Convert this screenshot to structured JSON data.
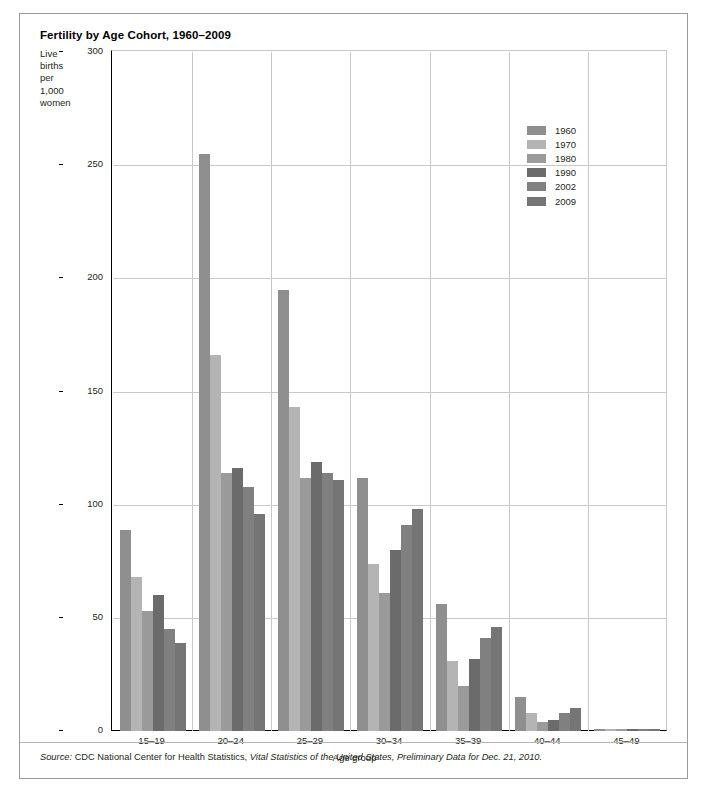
{
  "chart_data": {
    "type": "bar",
    "title": "Fertility by Age Cohort, 1960–2009",
    "xlabel": "Age group",
    "ylabel": "Live births per 1,000 women",
    "ylabel_lines": [
      "Live",
      "births",
      "per",
      "1,000",
      "women"
    ],
    "ylim": [
      0,
      300
    ],
    "yticks": [
      0,
      50,
      100,
      150,
      200,
      250,
      300
    ],
    "ytick_labels": [
      "0",
      "50",
      "100",
      "150",
      "200",
      "250",
      "300"
    ],
    "grid": "horizontal-and-vertical",
    "legend_position": "upper-right-inside",
    "categories": [
      "15–19",
      "20–24",
      "25–29",
      "30–34",
      "35–39",
      "40–44",
      "45–49"
    ],
    "series": [
      {
        "name": "1960",
        "color": "#8f8f8f",
        "values": [
          89,
          255,
          195,
          112,
          56,
          15,
          1
        ]
      },
      {
        "name": "1970",
        "color": "#b4b4b4",
        "values": [
          68,
          166,
          143,
          74,
          31,
          8,
          1
        ]
      },
      {
        "name": "1980",
        "color": "#9a9a9a",
        "values": [
          53,
          114,
          112,
          61,
          20,
          4,
          1
        ]
      },
      {
        "name": "1990",
        "color": "#6b6b6b",
        "values": [
          60,
          116,
          119,
          80,
          32,
          5,
          1
        ]
      },
      {
        "name": "2002",
        "color": "#808080",
        "values": [
          45,
          108,
          114,
          91,
          41,
          8,
          1
        ]
      },
      {
        "name": "2009",
        "color": "#757575",
        "values": [
          39,
          96,
          111,
          98,
          46,
          10,
          1
        ]
      }
    ],
    "source_prefix": "Source:",
    "source_plain": " CDC National Center for Health Statistics, ",
    "source_italic": "Vital Statistics of the United States, Preliminary Data for Dec. 21, 2010."
  }
}
